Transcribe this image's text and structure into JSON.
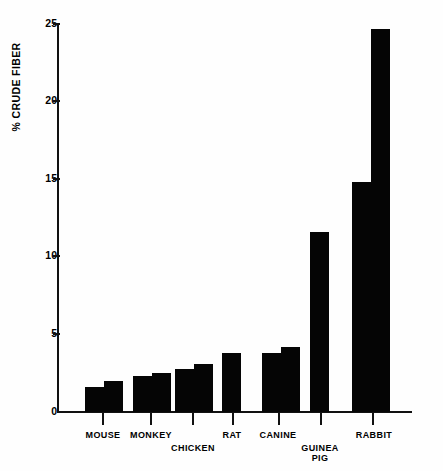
{
  "chart_data": {
    "type": "bar",
    "title": "",
    "subtitle": "",
    "xlabel": "",
    "ylabel": "% CRUDE FIBER",
    "ylim": [
      0,
      25
    ],
    "ytick_values": [
      0,
      5,
      10,
      15,
      20,
      25
    ],
    "ytick_labels": [
      "0",
      "5",
      "10",
      "15",
      "20",
      "25"
    ],
    "grid": false,
    "legend": "none",
    "bar_color": "#050505",
    "axis_color": "#111111",
    "categories": [
      "MOUSE",
      "MONKEY",
      "CHICKEN",
      "RAT",
      "CANINE",
      "GUINEA PIG",
      "RABBIT"
    ],
    "category_label_lines": [
      [
        "MOUSE"
      ],
      [
        "MONKEY"
      ],
      [
        "CHICKEN"
      ],
      [
        "RAT"
      ],
      [
        "CANINE"
      ],
      [
        "GUINEA",
        "PIG"
      ],
      [
        "RABBIT"
      ]
    ],
    "note": "Each category is drawn as a pair of adjacent bars (a low and a high value) except RAT and GUINEA PIG which show a single bar.",
    "groups": [
      {
        "category": "MOUSE",
        "values": [
          1.6,
          2.0
        ]
      },
      {
        "category": "MONKEY",
        "values": [
          2.3,
          2.5
        ]
      },
      {
        "category": "CHICKEN",
        "values": [
          2.8,
          3.1
        ]
      },
      {
        "category": "RAT",
        "values": [
          3.8
        ]
      },
      {
        "category": "CANINE",
        "values": [
          3.8,
          4.2
        ]
      },
      {
        "category": "GUINEA PIG",
        "values": [
          11.6
        ]
      },
      {
        "category": "RABBIT",
        "values": [
          14.8,
          24.7
        ]
      }
    ],
    "series": [
      {
        "name": "lower value",
        "values": [
          1.6,
          2.3,
          2.8,
          3.8,
          3.8,
          11.6,
          14.8
        ]
      },
      {
        "name": "upper value",
        "values": [
          2.0,
          2.5,
          3.1,
          null,
          4.2,
          null,
          24.7
        ]
      }
    ]
  },
  "axes": {
    "y_title": "% CRUDE FIBER",
    "y_ticks": [
      {
        "label": "25",
        "value": 25
      },
      {
        "label": "20",
        "value": 20
      },
      {
        "label": "15",
        "value": 15
      },
      {
        "label": "10",
        "value": 10
      },
      {
        "label": "5",
        "value": 5
      },
      {
        "label": "0",
        "value": 0
      }
    ]
  },
  "x_labels": [
    {
      "text": "MOUSE",
      "line2": ""
    },
    {
      "text": "MONKEY",
      "line2": ""
    },
    {
      "text": "CHICKEN",
      "line2": ""
    },
    {
      "text": "RAT",
      "line2": ""
    },
    {
      "text": "CANINE",
      "line2": ""
    },
    {
      "text": "GUINEA",
      "line2": "PIG"
    },
    {
      "text": "RABBIT",
      "line2": ""
    }
  ]
}
